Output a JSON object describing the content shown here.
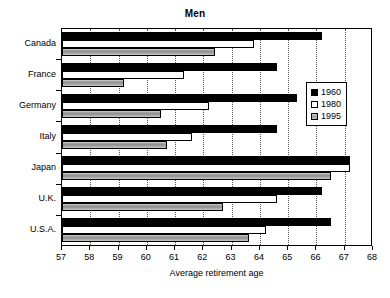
{
  "chart_data": {
    "type": "bar",
    "orientation": "horizontal",
    "title": "Men",
    "xlabel": "Average retirement age",
    "ylabel": "",
    "xlim": [
      57,
      68
    ],
    "xticks": [
      57,
      58,
      59,
      60,
      61,
      62,
      63,
      64,
      65,
      66,
      67,
      68
    ],
    "grid": true,
    "grid_axis": "x",
    "legend_position": "right",
    "categories": [
      "Canada",
      "France",
      "Germany",
      "Italy",
      "Japan",
      "U.K.",
      "U.S.A."
    ],
    "series": [
      {
        "name": "1960",
        "color": "#000000",
        "values": [
          66.2,
          64.6,
          65.3,
          64.6,
          67.2,
          66.2,
          66.5
        ]
      },
      {
        "name": "1980",
        "color": "#ffffff",
        "values": [
          63.8,
          61.3,
          62.2,
          61.6,
          67.2,
          64.6,
          64.2
        ]
      },
      {
        "name": "1995",
        "color": "#a0a0a0",
        "values": [
          62.4,
          59.2,
          60.5,
          60.7,
          66.5,
          62.7,
          63.6
        ]
      }
    ]
  },
  "legend": {
    "entries": [
      {
        "label": "1960"
      },
      {
        "label": "1980"
      },
      {
        "label": "1995"
      }
    ]
  }
}
